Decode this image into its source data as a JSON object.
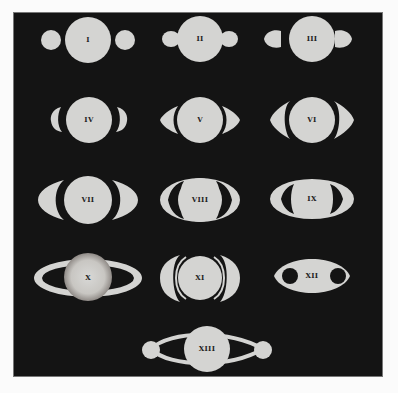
{
  "plate": {
    "title": "Saturn appearances I–XIII",
    "colors": {
      "background": "#141414",
      "figure": "#d4d4d2",
      "page": "#fbfbfb"
    }
  },
  "figures": [
    {
      "label": "I",
      "row": 1,
      "col": 1,
      "shape": "planet with two detached round moons"
    },
    {
      "label": "II",
      "row": 1,
      "col": 2,
      "shape": "planet with attached lobes (handles)"
    },
    {
      "label": "III",
      "row": 1,
      "col": 3,
      "shape": "planet with detached tear-drop ansae"
    },
    {
      "label": "IV",
      "row": 2,
      "col": 1,
      "shape": "planet with small crescent ansae"
    },
    {
      "label": "V",
      "row": 2,
      "col": 2,
      "shape": "planet with pointed crescent ansae"
    },
    {
      "label": "VI",
      "row": 2,
      "col": 3,
      "shape": "planet with thin arched ring arms"
    },
    {
      "label": "VII",
      "row": 3,
      "col": 1,
      "shape": "planet with broad crescent arms"
    },
    {
      "label": "VIII",
      "row": 3,
      "col": 2,
      "shape": "planet within full elliptical ring"
    },
    {
      "label": "IX",
      "row": 3,
      "col": 3,
      "shape": "planet in ellipse with dark gaps"
    },
    {
      "label": "X",
      "row": 4,
      "col": 1,
      "shape": "mottled planet with thin flat ring"
    },
    {
      "label": "XI",
      "row": 4,
      "col": 2,
      "shape": "planet with double-arc rings"
    },
    {
      "label": "XII",
      "row": 4,
      "col": 3,
      "shape": "oval with two dark holes"
    },
    {
      "label": "XIII",
      "row": 5,
      "col": 2,
      "shape": "planet with two moons joined by arcs"
    }
  ]
}
